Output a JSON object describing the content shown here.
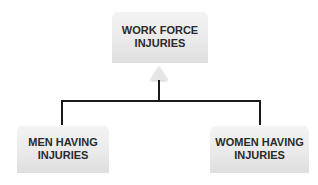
{
  "diagram": {
    "type": "hierarchy",
    "root": {
      "line1": "WORK FORCE",
      "line2": "INJURIES"
    },
    "children": [
      {
        "line1": "MEN HAVING",
        "line2": "INJURIES"
      },
      {
        "line1": "WOMEN HAVING",
        "line2": "INJURIES"
      }
    ],
    "colors": {
      "box_fill": "#e9e9e9",
      "text": "#2a2a2a",
      "connector": "#1a1a1a",
      "background": "#ffffff"
    }
  }
}
